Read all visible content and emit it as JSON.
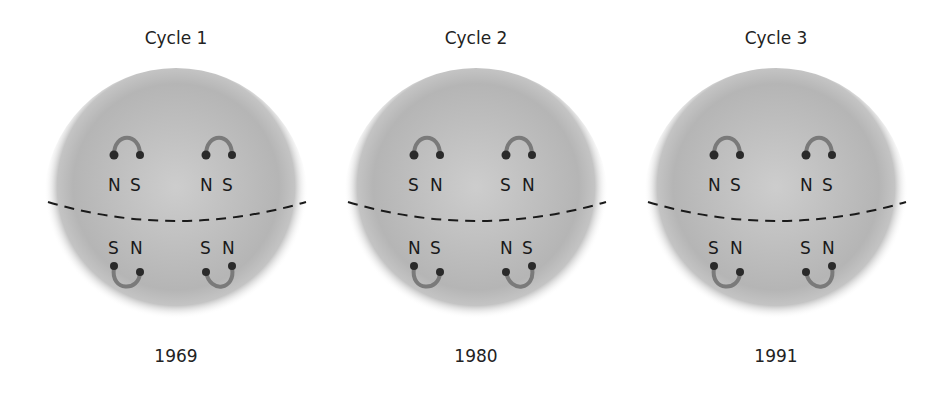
{
  "diagram": {
    "colors": {
      "sun_center": "#c8c8c8",
      "sun_edge": "#a9a9a9",
      "loop": "#7a7a7a",
      "footpoint": "#2a2a2a",
      "equator": "#1a1a1a",
      "text": "#222222"
    },
    "panels": [
      {
        "title": "Cycle 1",
        "year": "1969",
        "northern": [
          {
            "left": "N",
            "right": "S"
          },
          {
            "left": "N",
            "right": "S"
          }
        ],
        "southern": [
          {
            "left": "S",
            "right": "N"
          },
          {
            "left": "S",
            "right": "N"
          }
        ]
      },
      {
        "title": "Cycle 2",
        "year": "1980",
        "northern": [
          {
            "left": "S",
            "right": "N"
          },
          {
            "left": "S",
            "right": "N"
          }
        ],
        "southern": [
          {
            "left": "N",
            "right": "S"
          },
          {
            "left": "N",
            "right": "S"
          }
        ]
      },
      {
        "title": "Cycle 3",
        "year": "1991",
        "northern": [
          {
            "left": "N",
            "right": "S"
          },
          {
            "left": "N",
            "right": "S"
          }
        ],
        "southern": [
          {
            "left": "S",
            "right": "N"
          },
          {
            "left": "S",
            "right": "N"
          }
        ]
      }
    ]
  }
}
